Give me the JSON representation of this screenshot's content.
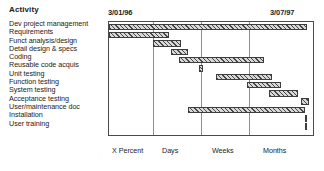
{
  "header": {
    "column_title": "Activity",
    "date_start": "3/01/96",
    "date_end": "3/07/97"
  },
  "x_axis_captions": [
    "X Percent",
    "Days",
    "Weeks",
    "Months"
  ],
  "chart_data": {
    "type": "bar",
    "subtype": "gantt",
    "title": "Activity",
    "xlabel": "",
    "ylabel": "Activity",
    "x_start_label": "3/01/96",
    "x_end_label": "3/07/97",
    "xlim": [
      0,
      100
    ],
    "grid": true,
    "gridlines": [
      21.5,
      45.0,
      68.5
    ],
    "legend": null,
    "categories": [
      "Dev project management",
      "Requirements",
      "Funct analysis/design",
      "Detail design & specs",
      "Coding",
      "Reusable code acquis",
      "Unit testing",
      "Function testing",
      "System testing",
      "Acceptance testing",
      "User/maintenance doc",
      "Installation",
      "User training"
    ],
    "tick_labels": [
      "X Percent",
      "Days",
      "Weeks",
      "Months"
    ],
    "bars": [
      {
        "label": "Dev project management",
        "start": 0.0,
        "end": 97.0,
        "duration": 97.0
      },
      {
        "label": "Requirements",
        "start": 0.0,
        "end": 29.5,
        "duration": 29.5
      },
      {
        "label": "Funct analysis/design",
        "start": 21.5,
        "end": 35.5,
        "duration": 14.0
      },
      {
        "label": "Detail design & specs",
        "start": 30.5,
        "end": 38.5,
        "duration": 8.0
      },
      {
        "label": "Coding",
        "start": 34.5,
        "end": 76.0,
        "duration": 41.5
      },
      {
        "label": "Reusable code acquis",
        "start": 44.0,
        "end": 46.0,
        "duration": 2.0
      },
      {
        "label": "Unit testing",
        "start": 52.5,
        "end": 80.0,
        "duration": 27.5
      },
      {
        "label": "Function testing",
        "start": 67.5,
        "end": 84.5,
        "duration": 17.0
      },
      {
        "label": "System testing",
        "start": 78.5,
        "end": 92.5,
        "duration": 14.0
      },
      {
        "label": "Acceptance testing",
        "start": 94.0,
        "end": 98.0,
        "duration": 4.0
      },
      {
        "label": "User/maintenance doc",
        "start": 38.5,
        "end": 96.0,
        "duration": 57.5
      },
      {
        "label": "Installation",
        "start": 96.0,
        "end": 97.2,
        "duration": 1.2
      },
      {
        "label": "User training",
        "start": 96.0,
        "end": 97.2,
        "duration": 1.2
      }
    ]
  },
  "style": {
    "bar_fill": "#d8d8d8",
    "bar_border": "#3d3d3d",
    "grid_color": "#8e8e8e",
    "plot_border": "#4a4a4a",
    "text_color": "#1b1b1b"
  }
}
